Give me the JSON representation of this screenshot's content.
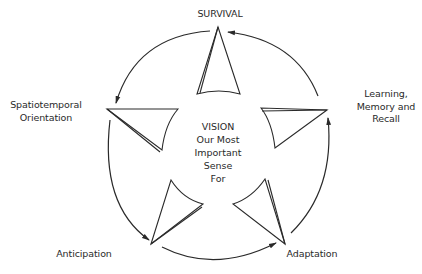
{
  "diagram": {
    "title": "VISION Our Most Important Sense For",
    "center_lines": [
      "VISION",
      "Our Most",
      "Important",
      "Sense",
      "For"
    ],
    "nodes": [
      {
        "id": "survival",
        "label": "SURVIVAL"
      },
      {
        "id": "learning",
        "label_lines": [
          "Learning,",
          "Memory and",
          "Recall"
        ]
      },
      {
        "id": "adaptation",
        "label": "Adaptation"
      },
      {
        "id": "anticipation",
        "label": "Anticipation"
      },
      {
        "id": "spatiotemporal",
        "label_lines": [
          "Spatiotemporal",
          "Orientation"
        ]
      }
    ],
    "cycle_direction": "counterclockwise",
    "edges": [
      {
        "from": "learning",
        "to": "survival"
      },
      {
        "from": "survival",
        "to": "spatiotemporal"
      },
      {
        "from": "spatiotemporal",
        "to": "anticipation"
      },
      {
        "from": "anticipation",
        "to": "adaptation"
      },
      {
        "from": "adaptation",
        "to": "learning"
      }
    ],
    "colors": {
      "stroke": "#2a2a2a",
      "background": "#ffffff"
    }
  }
}
